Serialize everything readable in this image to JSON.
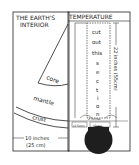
{
  "left_panel": {
    "title_line1": "THE EARTH'S",
    "title_line2": "INTERIOR",
    "layers": {
      "core": "core",
      "mantle": "mantle",
      "crust": "crust"
    },
    "width_label": "10 inches",
    "width_label_metric": "(25 cm)"
  },
  "right_panel": {
    "title": "TEMPERATURE",
    "cutout_text": [
      "cut",
      "out",
      "this",
      "s",
      "e",
      "c",
      "t",
      "i",
      "o",
      "n"
    ],
    "height_label": "22 inches (55cm)",
    "small_label_left": "1 inch",
    "small_label_left_metric": "(2.5cm)",
    "small_label_right": "2 inches",
    "small_label_right_metric": "(5cm)"
  },
  "colors": {
    "ink": "#222222",
    "bulb": "#1e1e1e",
    "background": "#ffffff"
  }
}
